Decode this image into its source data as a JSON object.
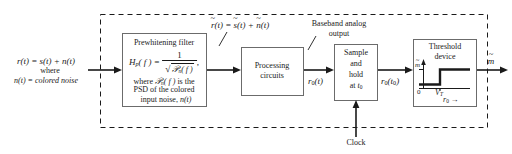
{
  "figure": {
    "stroke_color": "#1a1a1a",
    "dashed_boundary_label": ""
  },
  "input": {
    "line1": "r(t)  =  s(t)  +  n(t)",
    "line2": "where",
    "line3": "n(t) = colored noise"
  },
  "blocks": {
    "prewhitening": {
      "title": "Prewhitening filter",
      "formula_lhs": "H",
      "formula_lhs_sub": "p",
      "formula_lhs_arg": "( f )  =",
      "formula_numerator": "1",
      "formula_denominator_radicand": "n( f )",
      "formula_denominator_script": "ᵋ",
      "formula_trailer": ",",
      "note_line1": "where ᵋ n( f ) is the",
      "note_line2": "PSD of the colored",
      "note_line3": "input noise, n(t)"
    },
    "processing": {
      "line1": "Processing",
      "line2": "circuits"
    },
    "sample_hold": {
      "line1": "Sample",
      "line2": "and",
      "line3": "hold",
      "line4": "at t",
      "line4_sub": "0"
    },
    "threshold": {
      "line1": "Threshold",
      "line2": "device",
      "graph": {
        "y_axis_label": "m",
        "y_axis_tilde": "~",
        "origin_label": "0",
        "threshold_label": "V",
        "threshold_label_sub": "T",
        "x_axis_label": "r",
        "x_axis_label_sub": "0",
        "x_axis_arrow": "→"
      }
    }
  },
  "signals": {
    "prewhitened": {
      "r": "r",
      "eq": "(t)  =",
      "s": "s",
      "s_arg": "(t)  +",
      "n": "n",
      "n_arg": "(t)",
      "tilde": "~"
    },
    "baseband_label_line1": "Baseband analog",
    "baseband_label_line2": "output",
    "r0_t": "r",
    "r0_t_sub": "0",
    "r0_t_arg": "(t)",
    "r0_t0": "r",
    "r0_t0_sub": "0",
    "r0_t0_arg": "(t",
    "r0_t0_sub2": "0",
    "r0_t0_close": ")",
    "clock": "Clock",
    "output": "m",
    "output_tilde": "~"
  }
}
